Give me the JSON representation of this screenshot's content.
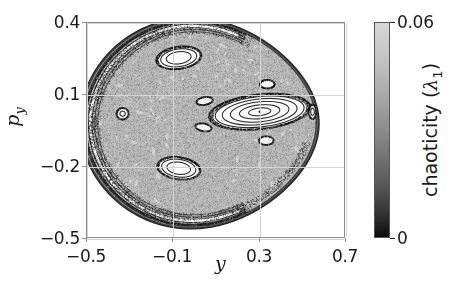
{
  "figure": {
    "type": "poincare-section",
    "background": "#ffffff"
  },
  "axes": {
    "xlabel": "y",
    "ylabel_base": "p",
    "ylabel_sub": "y",
    "xticks": [
      {
        "value": -0.5,
        "label": "−0.5"
      },
      {
        "value": -0.1,
        "label": "−0.1"
      },
      {
        "value": 0.3,
        "label": "0.3"
      },
      {
        "value": 0.7,
        "label": "0.7"
      }
    ],
    "yticks": [
      {
        "value": 0.4,
        "label": "0.4"
      },
      {
        "value": 0.1,
        "label": "0.1"
      },
      {
        "value": -0.2,
        "label": "−0.2"
      },
      {
        "value": -0.5,
        "label": "−0.5"
      }
    ],
    "xlim": [
      -0.5,
      0.7
    ],
    "ylim": [
      -0.5,
      0.4
    ],
    "grid": true,
    "grid_color": "#d4d4d4",
    "frame_color": "#8d8d8d"
  },
  "colorbar": {
    "title_base": "chaoticity (",
    "title_symbol": "λ",
    "title_sub": "1",
    "title_close": ")",
    "ticks": [
      {
        "value": 0.06,
        "label": "0.06",
        "position": "top"
      },
      {
        "value": 0,
        "label": "0",
        "position": "bottom"
      }
    ],
    "vmin": 0,
    "vmax": 0.06,
    "cmap": "grayscale-inverted",
    "color_top": "#d8d8d8",
    "color_bottom": "#0a0a0a"
  },
  "chart_data": {
    "type": "scatter",
    "title": "",
    "xlabel": "y",
    "ylabel": "p_y",
    "xlim": [
      -0.5,
      0.7
    ],
    "ylim": [
      -0.5,
      0.4
    ],
    "colorbar_label": "chaoticity (lambda_1)",
    "colorbar_range": [
      0,
      0.06
    ],
    "regions": [
      {
        "name": "chaotic-sea",
        "chaoticity": 0.042,
        "shade": "#bdbdbd"
      },
      {
        "name": "outer-boundary-layer",
        "chaoticity": 0.004,
        "shade": "#303030"
      },
      {
        "name": "central-island-core",
        "chaoticity": 0.001,
        "shade": "#fdfdfd"
      },
      {
        "name": "upper-island-core",
        "chaoticity": 0.002,
        "shade": "#fbfbfb"
      },
      {
        "name": "lower-island-core",
        "chaoticity": 0.002,
        "shade": "#fbfbfb"
      },
      {
        "name": "left-island-core",
        "chaoticity": 0.003,
        "shade": "#f2f2f2"
      }
    ],
    "islands": [
      {
        "name": "central-island",
        "cx": 0.3,
        "cy": 0.03,
        "rx": 0.235,
        "ry": 0.072,
        "angle": -6
      },
      {
        "name": "upper-island",
        "cx": -0.075,
        "cy": 0.255,
        "rx": 0.105,
        "ry": 0.046,
        "angle": -8
      },
      {
        "name": "lower-island",
        "cx": -0.075,
        "cy": -0.205,
        "rx": 0.1,
        "ry": 0.046,
        "angle": 8
      },
      {
        "name": "left-island",
        "cx": -0.335,
        "cy": 0.022,
        "rx": 0.028,
        "ry": 0.024,
        "angle": 0
      },
      {
        "name": "right-island",
        "cx": 0.545,
        "cy": 0.03,
        "rx": 0.017,
        "ry": 0.03,
        "angle": 0
      },
      {
        "name": "satellite-upper",
        "cx": 0.335,
        "cy": 0.145,
        "rx": 0.034,
        "ry": 0.018,
        "angle": 0
      },
      {
        "name": "satellite-lower",
        "cx": 0.33,
        "cy": -0.09,
        "rx": 0.034,
        "ry": 0.018,
        "angle": 0
      },
      {
        "name": "satellite-left-upper",
        "cx": 0.045,
        "cy": 0.075,
        "rx": 0.038,
        "ry": 0.016,
        "angle": -10
      },
      {
        "name": "satellite-left-lower",
        "cx": 0.04,
        "cy": -0.035,
        "rx": 0.038,
        "ry": 0.016,
        "angle": 10
      }
    ],
    "fixed_points": [
      {
        "name": "central-fixed-point",
        "x": 0.3,
        "y": 0.03
      }
    ]
  }
}
